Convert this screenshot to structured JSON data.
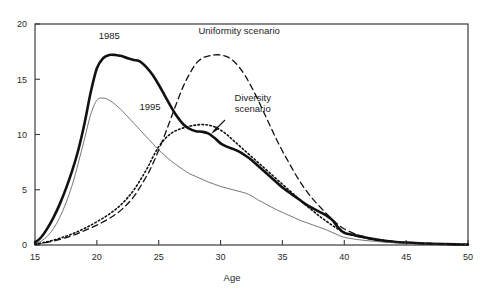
{
  "chart_data": {
    "type": "line",
    "title": "",
    "xlabel": "Age",
    "ylabel": "",
    "xlim": [
      15,
      50
    ],
    "ylim": [
      0,
      20
    ],
    "grid": false,
    "legend_position": "inline-annotations",
    "xticks": [
      15,
      20,
      25,
      30,
      35,
      40,
      45,
      50
    ],
    "yticks": [
      0,
      5,
      10,
      15,
      20
    ],
    "xtick_labels": [
      "15",
      "20",
      "25",
      "30",
      "35",
      "40",
      "45",
      "50"
    ],
    "ytick_labels": [
      "0",
      "5",
      "10",
      "15",
      "20"
    ],
    "annotations": [
      {
        "text": "1985",
        "x": 21.0,
        "y": 18.6
      },
      {
        "text": "1995",
        "x": 24.3,
        "y": 12.2
      },
      {
        "text": "Uniformity scenario",
        "x": 31.5,
        "y": 19.1
      },
      {
        "text": "Diversity scenario",
        "x": 32.6,
        "y": 13.0
      }
    ],
    "series": [
      {
        "name": "1985",
        "style": "solid-thick",
        "color": "#111111",
        "x": [
          15,
          15.5,
          16,
          16.5,
          17,
          17.5,
          18,
          18.5,
          19,
          19.5,
          20,
          20.5,
          21,
          21.5,
          22,
          22.5,
          23,
          23.5,
          24,
          24.5,
          25,
          25.5,
          26,
          26.5,
          27,
          27.5,
          28,
          28.5,
          29,
          29.5,
          30,
          30.5,
          31,
          31.5,
          32,
          32.5,
          33,
          33.5,
          34,
          34.5,
          35,
          35.5,
          36,
          36.5,
          37,
          37.5,
          38,
          38.5,
          39,
          39.5,
          40,
          41,
          42,
          43,
          44,
          45,
          46,
          47,
          48,
          49,
          50
        ],
        "y": [
          0.2,
          0.7,
          1.5,
          2.5,
          3.7,
          5.1,
          6.7,
          8.6,
          11.0,
          13.8,
          16.0,
          16.9,
          17.2,
          17.2,
          17.1,
          16.9,
          16.75,
          16.6,
          16.1,
          15.4,
          14.5,
          13.5,
          12.5,
          11.6,
          10.9,
          10.5,
          10.3,
          10.25,
          10.1,
          9.7,
          9.2,
          8.9,
          8.7,
          8.45,
          8.1,
          7.7,
          7.2,
          6.7,
          6.2,
          5.7,
          5.2,
          4.8,
          4.4,
          4.0,
          3.6,
          3.3,
          3.0,
          2.7,
          2.3,
          1.6,
          1.1,
          0.85,
          0.6,
          0.42,
          0.3,
          0.22,
          0.16,
          0.12,
          0.09,
          0.06,
          0.04
        ]
      },
      {
        "name": "1995",
        "style": "solid-thin",
        "color": "#666666",
        "x": [
          15,
          15.5,
          16,
          16.5,
          17,
          17.5,
          18,
          18.5,
          19,
          19.5,
          20,
          20.5,
          21,
          21.5,
          22,
          22.5,
          23,
          23.5,
          24,
          24.5,
          25,
          25.5,
          26,
          26.5,
          27,
          27.5,
          28,
          28.5,
          29,
          29.5,
          30,
          30.5,
          31,
          31.5,
          32,
          32.5,
          33,
          33.5,
          34,
          34.5,
          35,
          35.5,
          36,
          36.5,
          37,
          37.5,
          38,
          38.5,
          39,
          39.5,
          40,
          41,
          42,
          43,
          44,
          45,
          46,
          47,
          48,
          49,
          50
        ],
        "y": [
          0.1,
          0.35,
          0.8,
          1.5,
          2.5,
          3.8,
          5.4,
          7.4,
          9.6,
          11.8,
          13.1,
          13.3,
          13.1,
          12.7,
          12.2,
          11.6,
          11.0,
          10.4,
          9.8,
          9.2,
          8.6,
          8.1,
          7.6,
          7.2,
          6.8,
          6.45,
          6.2,
          5.95,
          5.7,
          5.5,
          5.3,
          5.15,
          5.0,
          4.85,
          4.7,
          4.45,
          4.1,
          3.8,
          3.5,
          3.2,
          2.95,
          2.7,
          2.45,
          2.2,
          2.0,
          1.8,
          1.6,
          1.4,
          1.15,
          0.9,
          0.7,
          0.5,
          0.38,
          0.28,
          0.2,
          0.15,
          0.11,
          0.08,
          0.06,
          0.04,
          0.03
        ]
      },
      {
        "name": "Uniformity scenario",
        "style": "dashed",
        "color": "#111111",
        "x": [
          15,
          16,
          17,
          18,
          19,
          20,
          21,
          22,
          23,
          24,
          24.5,
          25,
          25.5,
          26,
          26.5,
          27,
          27.5,
          28,
          28.5,
          29,
          29.5,
          30,
          30.5,
          31,
          31.5,
          32,
          32.5,
          33,
          33.5,
          34,
          34.5,
          35,
          35.5,
          36,
          36.5,
          37,
          37.5,
          38,
          38.5,
          39,
          39.5,
          40,
          41,
          42,
          43,
          44,
          45,
          46,
          47,
          48,
          49,
          50
        ],
        "y": [
          0.05,
          0.25,
          0.5,
          0.85,
          1.3,
          1.8,
          2.4,
          3.2,
          4.4,
          6.2,
          7.3,
          8.6,
          10.0,
          11.5,
          13.0,
          14.4,
          15.5,
          16.4,
          16.9,
          17.1,
          17.2,
          17.2,
          17.05,
          16.7,
          16.1,
          15.3,
          14.3,
          13.2,
          12.0,
          10.8,
          9.6,
          8.5,
          7.5,
          6.5,
          5.6,
          4.8,
          4.1,
          3.5,
          2.9,
          2.35,
          1.85,
          1.45,
          0.95,
          0.65,
          0.45,
          0.32,
          0.22,
          0.16,
          0.11,
          0.08,
          0.05,
          0.03
        ]
      },
      {
        "name": "Diversity scenario",
        "style": "dotted",
        "color": "#111111",
        "x": [
          15,
          16,
          17,
          18,
          19,
          20,
          21,
          22,
          23,
          24,
          24.5,
          25,
          25.5,
          26,
          26.5,
          27,
          27.5,
          28,
          28.5,
          29,
          29.5,
          30,
          30.5,
          31,
          31.5,
          32,
          32.5,
          33,
          33.5,
          34,
          34.5,
          35,
          35.5,
          36,
          36.5,
          37,
          37.5,
          38,
          38.5,
          39,
          39.5,
          40,
          41,
          42,
          43,
          44,
          45,
          46,
          47,
          48,
          49,
          50
        ],
        "y": [
          0.05,
          0.3,
          0.6,
          1.0,
          1.5,
          2.1,
          2.8,
          3.7,
          5.0,
          6.8,
          7.9,
          8.9,
          9.6,
          10.1,
          10.4,
          10.6,
          10.75,
          10.85,
          10.9,
          10.85,
          10.7,
          10.4,
          10.0,
          9.5,
          9.0,
          8.5,
          8.0,
          7.5,
          7.0,
          6.5,
          6.0,
          5.5,
          5.0,
          4.5,
          4.0,
          3.5,
          3.05,
          2.6,
          2.2,
          1.8,
          1.45,
          1.15,
          0.8,
          0.58,
          0.4,
          0.28,
          0.2,
          0.14,
          0.1,
          0.07,
          0.05,
          0.03
        ]
      }
    ]
  }
}
